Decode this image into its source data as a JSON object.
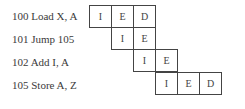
{
  "diagram": {
    "type": "pipeline",
    "rows": [
      {
        "label": "100 Load X, A",
        "start_col": 0,
        "stages": [
          "I",
          "E",
          "D"
        ]
      },
      {
        "label": "101 Jump 105",
        "start_col": 1,
        "stages": [
          "I",
          "E"
        ]
      },
      {
        "label": "102 Add I, A",
        "start_col": 2,
        "stages": [
          "I",
          "E"
        ]
      },
      {
        "label": "105 Store A, Z",
        "start_col": 3,
        "stages": [
          "I",
          "E",
          "D"
        ]
      }
    ]
  }
}
